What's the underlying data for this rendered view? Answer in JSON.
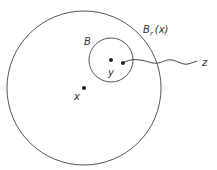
{
  "diagram": {
    "outer_ball": {
      "label_main": "B",
      "label_sub": "r",
      "label_arg": "(x)"
    },
    "inner_ball": {
      "label": "B"
    },
    "points": {
      "center_label": "x",
      "inner_point_label": "y",
      "external_label": "z"
    },
    "colors": {
      "stroke": "#555555",
      "dot": "#222222",
      "text": "#333333"
    }
  }
}
